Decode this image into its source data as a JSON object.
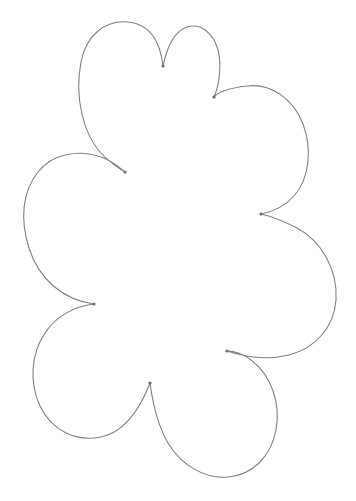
{
  "document": {
    "title": "Flower Petal Outline",
    "kind": "line-drawing",
    "background_color": "#ffffff",
    "width": 356,
    "height": 501
  },
  "drawing": {
    "name": "six-lobed-flower-outline",
    "description": "Hand-drawn closed outline of a flower or cloud shape with six rounded petal lobes joined by sharp inward cusps",
    "stroke_color": "#808080",
    "stroke_width": 1.1,
    "cusp_dot_color": "#6e6e6e",
    "cusp_dot_radius": 1.6,
    "fill": "none",
    "path_d": "M 163 66 C 160 40 150 24 128 22 C 104 20 86 36 81 62 C 74 98 84 134 100 152 C 110 163 118 168 125 172 C 118 166 110 160 101 157 C 78 149 52 154 38 172 C 22 192 20 220 29 248 C 39 280 64 300 94 304 C 75 306 56 316 45 333 C 31 354 29 382 40 406 C 52 431 76 442 101 437 C 122 433 139 412 150 383 C 152 398 157 424 168 443 C 182 466 205 479 228 477 C 253 475 271 456 276 430 C 281 403 271 375 251 360 C 243 354 234 351 227 351 C 245 357 268 360 289 355 C 316 348 334 327 336 300 C 338 271 322 241 297 228 C 283 221 270 216 261 214 C 272 212 285 206 294 196 C 310 178 312 148 303 124 C 293 98 270 83 247 86 C 230 88 218 92 214 97 C 219 86 222 66 218 50 C 213 32 200 23 187 27 C 175 31 167 47 163 66 Z",
    "cusps": [
      {
        "name": "cusp-top-center",
        "x": 163,
        "y": 66
      },
      {
        "name": "cusp-upper-right",
        "x": 214,
        "y": 97
      },
      {
        "name": "cusp-right-middle",
        "x": 261,
        "y": 214
      },
      {
        "name": "cusp-lower-right",
        "x": 227,
        "y": 351
      },
      {
        "name": "cusp-bottom-center",
        "x": 150,
        "y": 383
      },
      {
        "name": "cusp-left-lower",
        "x": 94,
        "y": 304
      },
      {
        "name": "cusp-left-upper",
        "x": 125,
        "y": 172
      }
    ],
    "lobes": [
      {
        "name": "lobe-top-left",
        "apex_x": 110,
        "apex_y": 23
      },
      {
        "name": "lobe-top-right",
        "apex_x": 196,
        "apex_y": 28
      },
      {
        "name": "lobe-right-upper",
        "apex_x": 305,
        "apex_y": 150
      },
      {
        "name": "lobe-right-lower",
        "apex_x": 335,
        "apex_y": 300
      },
      {
        "name": "lobe-bottom",
        "apex_x": 228,
        "apex_y": 478
      },
      {
        "name": "lobe-bottom-left",
        "apex_x": 80,
        "apex_y": 437
      },
      {
        "name": "lobe-left",
        "apex_x": 23,
        "apex_y": 212
      }
    ]
  }
}
